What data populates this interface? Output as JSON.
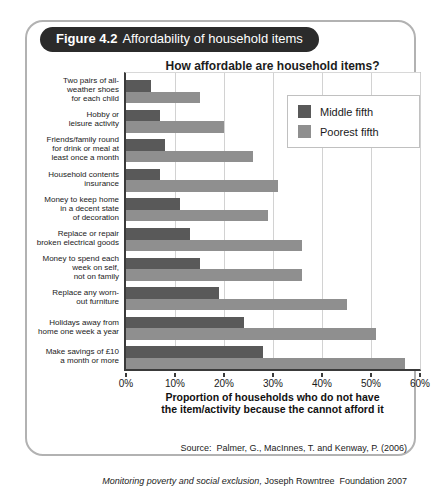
{
  "figure": {
    "badge_label": "Figure 4.2",
    "badge_title": "Affordability of household items"
  },
  "chart_data": {
    "type": "bar",
    "orientation": "horizontal",
    "title": "How affordable are household items?",
    "categories": [
      "Two pairs of all-\nweather shoes\nfor each child",
      "Hobby or\nleisure activity",
      "Friends/family round\nfor drink or meal at\nleast once a month",
      "Household contents\ninsurance",
      "Money to keep home\nin a decent state\nof decoration",
      "Replace or repair\nbroken electrical goods",
      "Money to spend each\nweek on self,\nnot on family",
      "Replace any worn-\nout furniture",
      "Holidays away from\nhome one week a year",
      "Make savings of £10\na month or more"
    ],
    "series": [
      {
        "name": "Middle fifth",
        "color": "#595959",
        "values": [
          5,
          7,
          8,
          7,
          11,
          13,
          15,
          19,
          24,
          28
        ]
      },
      {
        "name": "Poorest fifth",
        "color": "#8f8f8f",
        "values": [
          15,
          20,
          26,
          31,
          29,
          36,
          36,
          45,
          51,
          57
        ]
      }
    ],
    "xlim": [
      0,
      60
    ],
    "x_tick_labels": [
      "0%",
      "10%",
      "20%",
      "30%",
      "40%",
      "50%",
      "60%"
    ],
    "xlabel": "Proportion of households who do not have\nthe item/activity because the cannot afford it",
    "legend_position": "upper right",
    "grid": "vertical gridlines every 10%"
  },
  "source": {
    "line1": "Source:  Palmer, G., MacInnes, T. and Kenway, P. (2006)",
    "line2_italic": "Monitoring poverty and social exclusion,",
    "line2_rest": " Joseph Rowntree  Foundation 2007"
  }
}
